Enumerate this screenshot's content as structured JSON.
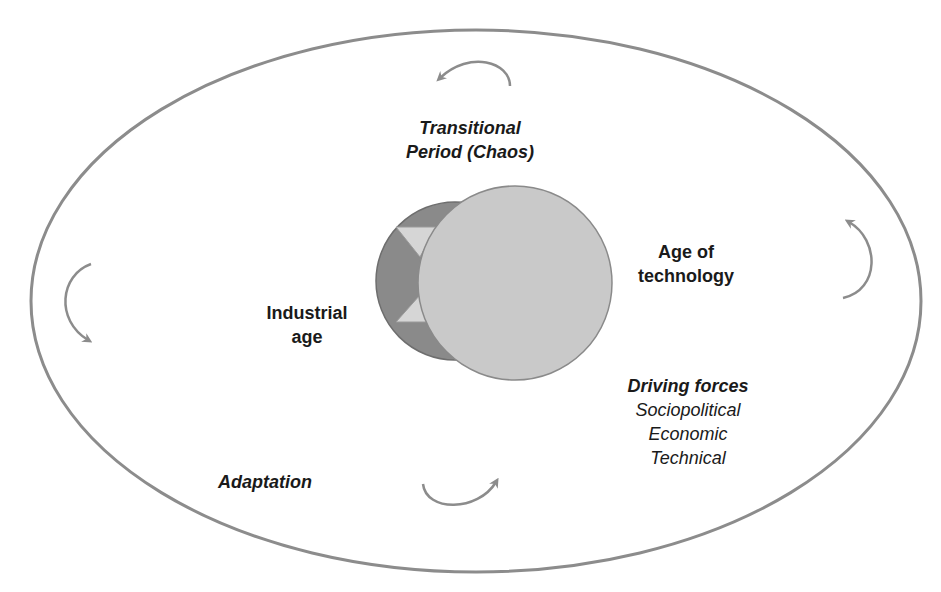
{
  "diagram": {
    "colors": {
      "outline": "#8c8c8c",
      "arrow": "#8c8c8c",
      "industrial_circle": "#8a8a8a",
      "technology_circle": "#c9c9c9",
      "triangles": "#d6d6d6",
      "text": "#1a1a1a"
    },
    "labels": {
      "transitional": {
        "line1": "Transitional",
        "line2": "Period (Chaos)"
      },
      "age_of_technology": {
        "line1": "Age of",
        "line2": "technology"
      },
      "industrial_age": {
        "line1": "Industrial",
        "line2": "age"
      },
      "driving_forces": {
        "title": "Driving forces",
        "items": [
          "Sociopolitical",
          "Economic",
          "Technical"
        ]
      },
      "adaptation": "Adaptation"
    },
    "icons": {
      "top_arrow": "curved-arrow-counterclockwise-icon",
      "left_arrow": "curved-arrow-down-icon",
      "bottom_arrow": "curved-arrow-right-icon",
      "right_arrow": "curved-arrow-up-icon"
    }
  }
}
